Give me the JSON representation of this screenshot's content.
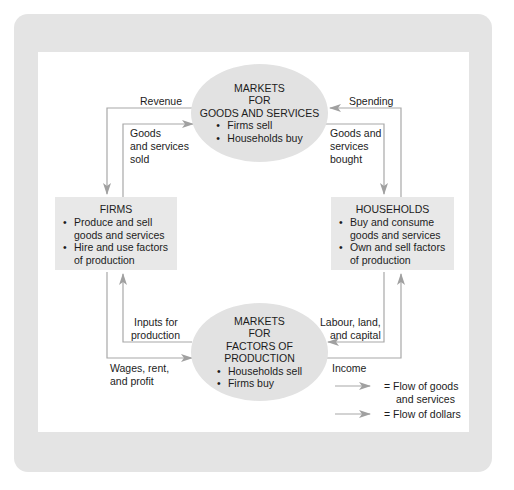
{
  "colors": {
    "frame": "#e4e4e4",
    "panel": "#ffffff",
    "node_fill": "#e2e2e2",
    "flow_line": "#a8a8a8",
    "arrow_head": "#a0a0a0"
  },
  "markets_goods": {
    "title_line1": "MARKETS",
    "title_line2": "FOR",
    "title_line3": "GOODS AND SERVICES",
    "bullets": [
      "Firms sell",
      "Households buy"
    ]
  },
  "markets_factors": {
    "title_line1": "MARKETS",
    "title_line2": "FOR",
    "title_line3": "FACTORS OF PRODUCTION",
    "bullets": [
      "Households sell",
      "Firms buy"
    ]
  },
  "firms": {
    "title": "FIRMS",
    "bullets": [
      "Produce and sell goods and services",
      "Hire and use factors of production"
    ]
  },
  "households": {
    "title": "HOUSEHOLDS",
    "bullets": [
      "Buy and consume goods and services",
      "Own and sell factors of production"
    ]
  },
  "flow_labels": {
    "revenue": "Revenue",
    "spending": "Spending",
    "goods_sold_1": "Goods",
    "goods_sold_2": "and services",
    "goods_sold_3": "sold",
    "goods_bought_1": "Goods and",
    "goods_bought_2": "services",
    "goods_bought_3": "bought",
    "inputs_1": "Inputs for",
    "inputs_2": "production",
    "labour_1": "Labour, land,",
    "labour_2": "and capital",
    "wages_1": "Wages, rent,",
    "wages_2": "and profit",
    "income": "Income"
  },
  "legend": {
    "goods_1": "= Flow of goods",
    "goods_2": "and services",
    "dollars": "= Flow of dollars"
  }
}
